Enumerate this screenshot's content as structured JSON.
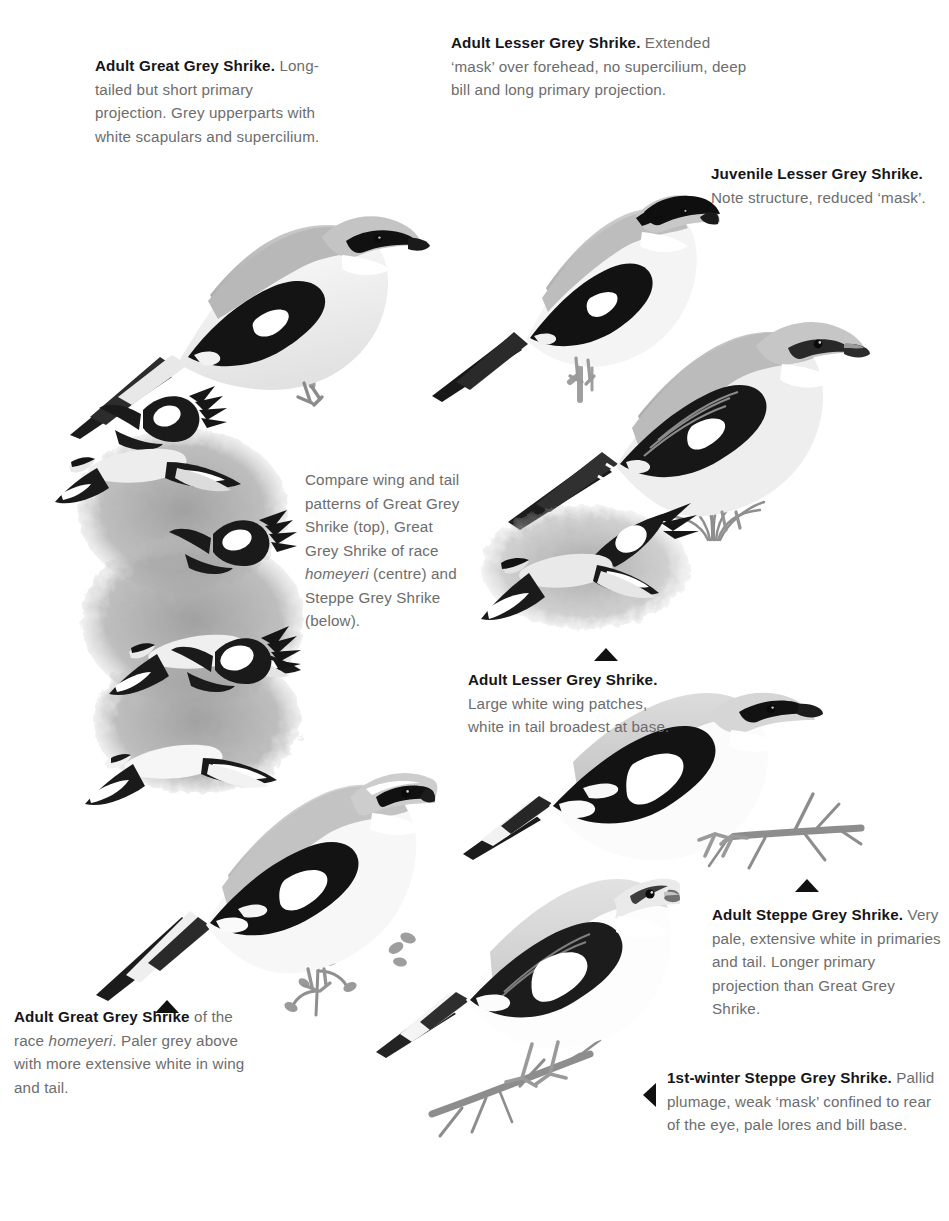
{
  "page": {
    "kind": "field-guide-identification-plate",
    "background_color": "#ffffff",
    "body_text_color": "#6d6d6d",
    "heading_text_color": "#15151a",
    "marker_color": "#111111",
    "wash_color": "#9a9a9a"
  },
  "captions": [
    {
      "id": "adult-great-grey-shrike",
      "lead": "Adult Great Grey Shrike.",
      "body": " Long-tailed but short primary projection. Grey upperparts with white scapulars and supercilium.",
      "x": 95,
      "y": 54,
      "width": 230,
      "align": "left"
    },
    {
      "id": "adult-lesser-grey-shrike-top",
      "lead": "Adult Lesser Grey Shrike.",
      "body": " Extended ‘mask’ over forehead, no supercilium, deep bill and long primary projection.",
      "x": 451,
      "y": 31,
      "width": 300,
      "align": "left"
    },
    {
      "id": "juvenile-lesser-grey-shrike",
      "lead": "Juvenile Lesser Grey Shrike.",
      "body": " Note structure, reduced ‘mask’.",
      "x": 711,
      "y": 162,
      "width": 215,
      "align": "left"
    },
    {
      "id": "compare-wing-and-tail",
      "lead": "",
      "body": "Compare wing and tail patterns of Great Grey Shrike (top), Great Grey Shrike of race ",
      "italic": "homeyeri",
      "body2": " (centre) and Steppe Grey Shrike (below).",
      "x": 305,
      "y": 468,
      "width": 160,
      "align": "left"
    },
    {
      "id": "adult-lesser-grey-shrike-flight",
      "lead": "Adult Lesser Grey Shrike.",
      "body": " Large white wing patches, white in tail broadest at base.",
      "x": 468,
      "y": 668,
      "width": 200,
      "align": "left"
    },
    {
      "id": "adult-steppe-grey-shrike",
      "lead": "Adult Steppe Grey Shrike.",
      "body": " Very pale, extensive white in primaries and tail. Longer primary projection than Great Grey Shrike.",
      "x": 712,
      "y": 903,
      "width": 226,
      "align": "left"
    },
    {
      "id": "first-winter-steppe-grey-shrike",
      "lead": "1st-winter Steppe Grey Shrike.",
      "body": " Pallid plumage, weak ‘mask’ confined to rear of the eye, pale lores and bill base.",
      "x": 667,
      "y": 1066,
      "width": 267,
      "align": "left"
    },
    {
      "id": "adult-great-grey-shrike-homeyeri",
      "lead": "Adult Great Grey Shrike",
      "body": " of the race ",
      "italic": "homeyeri",
      "body2": ". Paler grey above with more extensive white in wing and tail.",
      "x": 14,
      "y": 1005,
      "width": 230,
      "align": "left"
    }
  ],
  "markers": [
    {
      "id": "marker-lesser-grey-flight",
      "direction": "up",
      "x": 594,
      "y": 648
    },
    {
      "id": "marker-steppe-adult",
      "direction": "up",
      "x": 795,
      "y": 879
    },
    {
      "id": "marker-great-grey-homeyeri",
      "direction": "up",
      "x": 155,
      "y": 1000
    },
    {
      "id": "marker-first-winter-steppe",
      "direction": "left",
      "x": 643,
      "y": 1083
    }
  ],
  "figures": [
    {
      "id": "perched-adult-great-grey-shrike",
      "label": "Adult Great Grey Shrike perched on twig, facing right",
      "x": 60,
      "y": 105,
      "width": 370,
      "height": 330
    },
    {
      "id": "perched-adult-lesser-grey-shrike",
      "label": "Adult Lesser Grey Shrike perched on twig, facing right",
      "x": 430,
      "y": 100,
      "width": 290,
      "height": 330
    },
    {
      "id": "perched-juvenile-lesser-grey-shrike",
      "label": "Juvenile Lesser Grey Shrike perched, facing right, with grass tuft",
      "x": 505,
      "y": 245,
      "width": 360,
      "height": 300
    },
    {
      "id": "flight-panel-grey-shrikes",
      "label": "Six flying shrikes over grey wash: upper and under wing patterns",
      "x": 60,
      "y": 395,
      "width": 250,
      "height": 400
    },
    {
      "id": "flight-adult-lesser-grey-shrike",
      "label": "Adult Lesser Grey Shrike in flight over grey wash",
      "x": 470,
      "y": 500,
      "width": 225,
      "height": 155
    },
    {
      "id": "perched-great-grey-shrike-homeyeri",
      "label": "Adult Great Grey Shrike of race homeyeri perched on sprig",
      "x": 95,
      "y": 690,
      "width": 330,
      "height": 330
    },
    {
      "id": "perched-adult-steppe-grey-shrike",
      "label": "Adult Steppe Grey Shrike perched on thorny branch",
      "x": 470,
      "y": 690,
      "width": 390,
      "height": 200
    },
    {
      "id": "perched-first-winter-steppe-grey-shrike",
      "label": "1st-winter Steppe Grey Shrike perched on thorny branch",
      "x": 385,
      "y": 845,
      "width": 290,
      "height": 305
    }
  ]
}
